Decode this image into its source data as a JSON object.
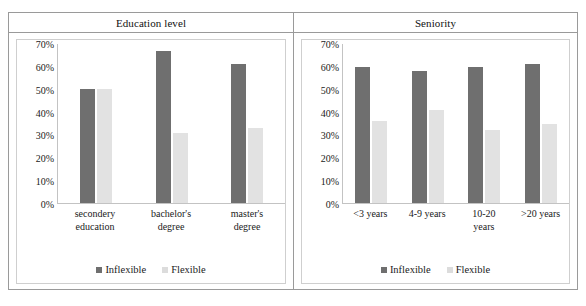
{
  "chart_data": [
    {
      "type": "bar",
      "title": "Education level",
      "categories": [
        "secondery education",
        "bachelor's degree",
        "master's degree"
      ],
      "category_lines": [
        [
          "secondery",
          "education"
        ],
        [
          "bachelor's",
          "degree"
        ],
        [
          "master's",
          "degree"
        ]
      ],
      "series": [
        {
          "name": "Inflexible",
          "values": [
            50,
            67,
            61
          ],
          "color": "#6f6f6f"
        },
        {
          "name": "Flexible",
          "values": [
            50,
            31,
            33
          ],
          "color": "#e2e2e2"
        }
      ],
      "xlabel": "",
      "ylabel": "",
      "ylim": [
        0,
        70
      ],
      "ytick_labels": [
        "70%",
        "60%",
        "50%",
        "40%",
        "30%",
        "20%",
        "10%",
        "0%"
      ],
      "ytick_values": [
        70,
        60,
        50,
        40,
        30,
        20,
        10,
        0
      ],
      "grid": false,
      "legend_position": "bottom"
    },
    {
      "type": "bar",
      "title": "Seniority",
      "categories": [
        "<3 years",
        "4-9 years",
        "10-20 years",
        ">20 years"
      ],
      "category_lines": [
        [
          "<3 years"
        ],
        [
          "4-9 years"
        ],
        [
          "10-20",
          "years"
        ],
        [
          ">20 years"
        ]
      ],
      "series": [
        {
          "name": "Inflexible",
          "values": [
            60,
            58,
            60,
            61
          ],
          "color": "#6f6f6f"
        },
        {
          "name": "Flexible",
          "values": [
            36,
            41,
            32,
            35
          ],
          "color": "#e2e2e2"
        }
      ],
      "xlabel": "",
      "ylabel": "",
      "ylim": [
        0,
        70
      ],
      "ytick_labels": [
        "70%",
        "60%",
        "50%",
        "40%",
        "30%",
        "20%",
        "10%",
        "0%"
      ],
      "ytick_values": [
        70,
        60,
        50,
        40,
        30,
        20,
        10,
        0
      ],
      "grid": false,
      "legend_position": "bottom"
    }
  ],
  "colors": {
    "inflexible": "#6f6f6f",
    "flexible": "#e2e2e2",
    "border": "#9a9a9a",
    "axis": "#c3c3c3"
  }
}
